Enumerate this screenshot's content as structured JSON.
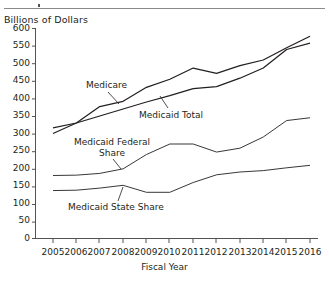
{
  "chart_data": {
    "type": "line",
    "title": "",
    "ylabel": "Billions of Dollars",
    "xlabel": "Fiscal Year",
    "ylim": [
      0,
      600
    ],
    "ytick_step": 50,
    "yticks": [
      "0",
      "50",
      "100",
      "150",
      "200",
      "250",
      "300",
      "350",
      "400",
      "450",
      "500",
      "550",
      "600"
    ],
    "grid": false,
    "legend_position": "inline-annotations",
    "x": [
      2005,
      2006,
      2007,
      2008,
      2009,
      2010,
      2011,
      2012,
      2013,
      2014,
      2015,
      2016
    ],
    "categories": [
      "2005",
      "2006",
      "2007",
      "2008",
      "2009",
      "2010",
      "2011",
      "2012",
      "2013",
      "2014",
      "2015",
      "2016"
    ],
    "series": [
      {
        "name": "Medicare",
        "values": [
          300,
          330,
          377,
          392,
          432,
          455,
          487,
          472,
          494,
          510,
          545,
          578
        ]
      },
      {
        "name": "Medicaid Total",
        "values": [
          316,
          330,
          350,
          370,
          390,
          408,
          428,
          434,
          458,
          487,
          540,
          558
        ]
      },
      {
        "name": "Medicaid Federal Share",
        "values": [
          180,
          181,
          186,
          199,
          240,
          270,
          270,
          247,
          258,
          290,
          337,
          345
        ]
      },
      {
        "name": "Medicaid State Share",
        "values": [
          137,
          138,
          144,
          152,
          132,
          132,
          160,
          182,
          190,
          194,
          202,
          209
        ]
      }
    ],
    "annotations": [
      {
        "text": "Medicare",
        "for": "Medicare"
      },
      {
        "text": "Medicaid Total",
        "for": "Medicaid Total"
      },
      {
        "text": "Medicaid Federal\nShare",
        "for": "Medicaid Federal Share"
      },
      {
        "text": "Medicaid State Share",
        "for": "Medicaid State Share"
      }
    ],
    "colors": {
      "line": "#231f20",
      "axis": "#56524f",
      "rule": "#8a8a8a",
      "text": "#231f20"
    }
  }
}
